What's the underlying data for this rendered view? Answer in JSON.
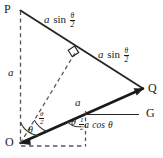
{
  "figure": {
    "type": "geometry-diagram",
    "width": 163,
    "height": 158,
    "colors": {
      "ink": "#1a1a1a",
      "solid_line": "#262626",
      "bold_line": "#1a1a1a",
      "dashed_line": "#555555",
      "background": "#ffffff"
    },
    "vertices": [
      {
        "name": "P",
        "label": "P",
        "x": 20,
        "y": 10
      },
      {
        "name": "Q",
        "label": "Q",
        "x": 143,
        "y": 89
      },
      {
        "name": "O",
        "label": "O",
        "x": 20,
        "y": 143
      },
      {
        "name": "G",
        "label": "G",
        "x": 140,
        "y": 114
      }
    ],
    "edge_labels": [
      {
        "name": "side-PM",
        "base": "a",
        "fn": "sin",
        "arg_num": "θ",
        "arg_den": "2",
        "x": 52,
        "y": 18
      },
      {
        "name": "side-MQ",
        "base": "a",
        "fn": "sin",
        "arg_num": "θ",
        "arg_den": "2",
        "x": 106,
        "y": 53
      },
      {
        "name": "side-OP",
        "base": "a",
        "x": 10,
        "y": 73
      },
      {
        "name": "segment-a-on-OQ",
        "base": "a",
        "x": 77,
        "y": 101
      }
    ],
    "composite_labels": [
      {
        "name": "half-a-cos-theta",
        "frac_num": "1",
        "frac_den": "2",
        "base": "a",
        "fn": "cos",
        "arg": "θ",
        "x": 84,
        "y": 120
      }
    ],
    "angle_labels": [
      {
        "name": "angle-theta-at-O",
        "text": "θ",
        "x": 31,
        "y": 130
      },
      {
        "name": "angle-half-theta-at-O",
        "num": "θ",
        "den": "2",
        "x": 41,
        "y": 117
      },
      {
        "name": "angle-theta-at-base",
        "text": "θ",
        "x": 73,
        "y": 122
      }
    ],
    "markers": [
      {
        "name": "right-angle-mark",
        "x": 74,
        "y": 52
      }
    ]
  }
}
